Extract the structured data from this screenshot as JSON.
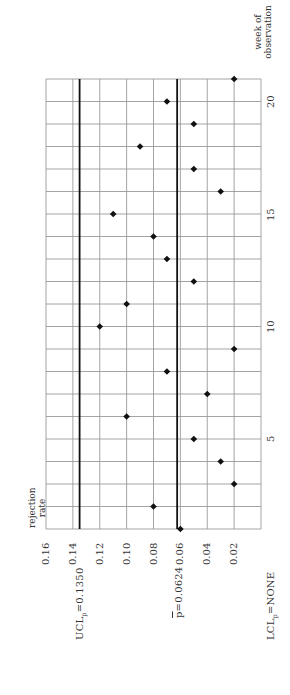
{
  "chart_data": {
    "type": "scatter",
    "title": "",
    "orientation": "rotated 90° counter-clockwise (x axis runs bottom-to-top)",
    "xlabel": "week of observation",
    "ylabel": "rejection rate",
    "x": [
      1,
      2,
      3,
      4,
      5,
      6,
      7,
      8,
      9,
      10,
      11,
      12,
      13,
      14,
      15,
      16,
      17,
      18,
      19,
      20,
      21
    ],
    "values": [
      0.06,
      0.08,
      0.02,
      0.03,
      0.05,
      0.1,
      0.04,
      0.07,
      0.02,
      0.12,
      0.1,
      0.05,
      0.07,
      0.08,
      0.11,
      0.03,
      0.05,
      0.09,
      0.05,
      0.07,
      0.02
    ],
    "xlim": [
      1,
      21
    ],
    "ylim": [
      0,
      0.16
    ],
    "x_ticks": [
      5,
      10,
      15,
      20
    ],
    "y_ticks": [
      "0.16",
      "0.14",
      "0.12",
      "0.10",
      "0.08",
      "0.06",
      "0.04",
      "0.02"
    ],
    "grid": true,
    "reference_lines": [
      {
        "name": "UCL",
        "value": 0.135,
        "label": "UCL",
        "sub": "p",
        "text": "=0.1350"
      },
      {
        "name": "p-bar",
        "value": 0.0624,
        "label": "p",
        "text": "=0.0624"
      }
    ],
    "annotations": [
      {
        "name": "LCL",
        "label": "LCL",
        "sub": "p",
        "text": "=NONE"
      }
    ],
    "marker": "diamond",
    "marker_color": "#111111",
    "line_color": "#111111",
    "grid_color": "#9a9a9a"
  },
  "labels": {
    "ylabel_line1": "rejection",
    "ylabel_line2": "rate",
    "xlabel_line1": "week of",
    "xlabel_line2": "observation",
    "ucl_main": "UCL",
    "ucl_sub": "p",
    "ucl_val": "=0.1350",
    "pbar_main": "p",
    "pbar_val": "=0.0624",
    "lcl_main": "LCL",
    "lcl_sub": "p",
    "lcl_val": "=NONE"
  }
}
